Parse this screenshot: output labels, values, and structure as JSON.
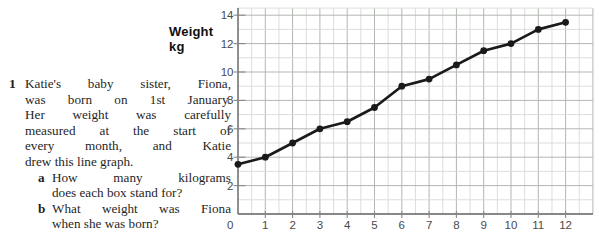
{
  "question": {
    "number": "1",
    "lines": [
      "Katie's baby sister, Fiona,",
      "was born on 1st January.",
      "Her weight was carefully",
      "measured at the start of",
      "every month, and Katie",
      "drew this line graph."
    ],
    "sub_questions": [
      {
        "letter": "a",
        "lines": [
          "How many kilograms",
          "does each box stand for?"
        ]
      },
      {
        "letter": "b",
        "lines": [
          "What weight was Fiona",
          "when she was born?"
        ]
      }
    ]
  },
  "chart": {
    "y_axis_title_line1": "Weight",
    "y_axis_title_line2": "kg"
  },
  "chart_data": {
    "type": "line",
    "title": "",
    "xlabel": "",
    "ylabel": "Weight kg",
    "x": [
      0,
      1,
      2,
      3,
      4,
      5,
      6,
      7,
      8,
      9,
      10,
      11,
      12
    ],
    "values": [
      3.5,
      4,
      5,
      6,
      6.5,
      7.5,
      9,
      9.5,
      10.5,
      11.5,
      12,
      13,
      13.5
    ],
    "x_ticks": [
      0,
      1,
      2,
      3,
      4,
      5,
      6,
      7,
      8,
      9,
      10,
      11,
      12
    ],
    "y_ticks": [
      0,
      2,
      4,
      6,
      8,
      10,
      12,
      14
    ],
    "xlim": [
      0,
      13
    ],
    "ylim": [
      0,
      14.5
    ],
    "grid": "on",
    "minor_grid": {
      "x_step": 0.5,
      "y_step": 1
    },
    "legend": "none",
    "colors": {
      "line": "#1a1a1a",
      "point": "#1a1a1a",
      "grid_minor": "#d7dad6",
      "grid_major": "#b2b7b1",
      "axis": "#616161",
      "tick_mark": "#878787",
      "tick_label": "#4a4a4a"
    }
  }
}
